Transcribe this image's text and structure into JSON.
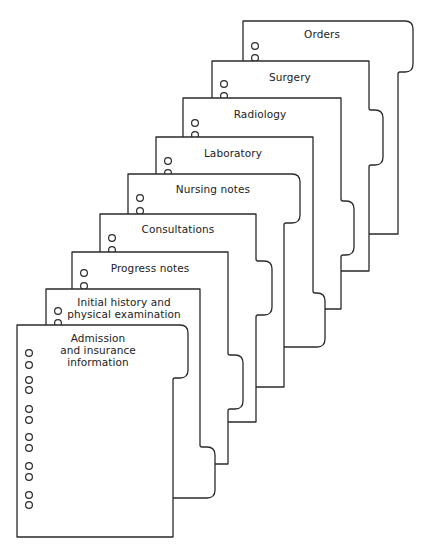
{
  "diagram": {
    "colors": {
      "line": "#2a2a2a",
      "paper": "#ffffff",
      "text": "#222222"
    },
    "pages": [
      {
        "label": "Orders",
        "left": 243,
        "top": 21,
        "right": 398,
        "bottom": 234,
        "tab": {
          "right": 413,
          "from": 21,
          "to": 72,
          "position": "top"
        },
        "text_x": 322,
        "text_y": 34,
        "holes": [
          46,
          58
        ]
      },
      {
        "label": "Surgery",
        "left": 212,
        "top": 61,
        "right": 369,
        "bottom": 271,
        "tab": {
          "right": 383,
          "from": 110,
          "to": 165,
          "position": "middle"
        },
        "text_x": 290,
        "text_y": 77,
        "holes": [
          84,
          96
        ]
      },
      {
        "label": "Radiology",
        "left": 183,
        "top": 98,
        "right": 341,
        "bottom": 309,
        "tab": {
          "right": 354,
          "from": 201,
          "to": 255,
          "position": "middle"
        },
        "text_x": 260,
        "text_y": 114,
        "holes": [
          123,
          135
        ]
      },
      {
        "label": "Laboratory",
        "left": 156,
        "top": 137,
        "right": 313,
        "bottom": 347,
        "tab": {
          "right": 325,
          "from": 293,
          "to": 347,
          "position": "bottom"
        },
        "text_x": 233,
        "text_y": 153,
        "holes": [
          161,
          173
        ]
      },
      {
        "label": "Nursing notes",
        "left": 128,
        "top": 174,
        "right": 284,
        "bottom": 387,
        "tab": {
          "right": 300,
          "from": 174,
          "to": 223,
          "position": "top"
        },
        "text_x": 213,
        "text_y": 189,
        "holes": [
          198,
          211
        ]
      },
      {
        "label": "Consultations",
        "left": 100,
        "top": 214,
        "right": 256,
        "bottom": 422,
        "tab": {
          "right": 272,
          "from": 261,
          "to": 315,
          "position": "middle"
        },
        "text_x": 178,
        "text_y": 229,
        "holes": [
          238,
          250
        ]
      },
      {
        "label": "Progress notes",
        "left": 72,
        "top": 252,
        "right": 228,
        "bottom": 464,
        "tab": {
          "right": 243,
          "from": 355,
          "to": 409,
          "position": "middle"
        },
        "text_x": 150,
        "text_y": 268,
        "holes": [
          273,
          286
        ]
      },
      {
        "label": "Initial history and\nphysical examination",
        "left": 46,
        "top": 289,
        "right": 200,
        "bottom": 498,
        "tab": {
          "right": 215,
          "from": 447,
          "to": 498,
          "position": "bottom"
        },
        "text_x": 124,
        "text_y": 308,
        "holes": [
          311,
          323
        ]
      },
      {
        "label": "Admission\nand insurance\ninformation",
        "left": 17,
        "top": 325,
        "right": 173,
        "bottom": 537,
        "tab": {
          "right": 188,
          "from": 325,
          "to": 378,
          "position": "top"
        },
        "text_x": 98,
        "text_y": 350,
        "holes": [
          353,
          365,
          380,
          390,
          409,
          420,
          437,
          448,
          466,
          477,
          495,
          505
        ]
      }
    ],
    "hole_offset_x": 12,
    "hole_radius": 3.4,
    "corner_radius": 8
  }
}
